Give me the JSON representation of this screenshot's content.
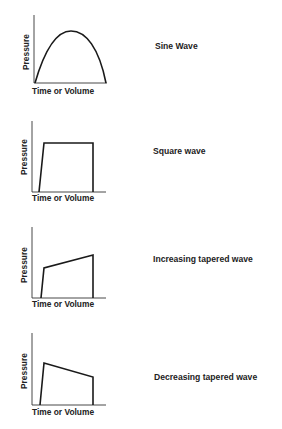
{
  "panels": [
    {
      "title": "Sine Wave",
      "xlabel": "Time or Volume",
      "ylabel": "Pressure",
      "shape": "sine"
    },
    {
      "title": "Square wave",
      "xlabel": "Time or Volume",
      "ylabel": "Pressure",
      "shape": "square"
    },
    {
      "title": "Increasing tapered wave",
      "xlabel": "Time or Volume",
      "ylabel": "Pressure",
      "shape": "increasing-taper"
    },
    {
      "title": "Decreasing tapered wave",
      "xlabel": "Time or Volume",
      "ylabel": "Pressure",
      "shape": "decreasing-taper"
    }
  ],
  "colors": {
    "line": "#1a1a1a",
    "axis": "#333333",
    "background": "#ffffff"
  }
}
